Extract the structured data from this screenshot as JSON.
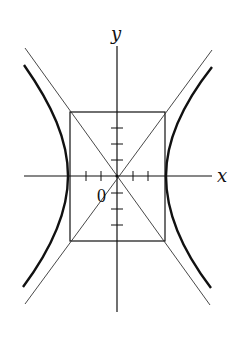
{
  "diagram": {
    "type": "hyperbola-with-asymptotes",
    "labels": {
      "x_axis": "x",
      "y_axis": "y",
      "origin": "0"
    },
    "colors": {
      "stroke": "#111111",
      "background": "#ffffff"
    },
    "elements": [
      "x-axis",
      "y-axis",
      "central rectangle",
      "two asymptotes (diagonals)",
      "left hyperbola branch",
      "right hyperbola branch"
    ],
    "x_ticks_per_side": 2,
    "y_ticks_per_side": 3
  }
}
